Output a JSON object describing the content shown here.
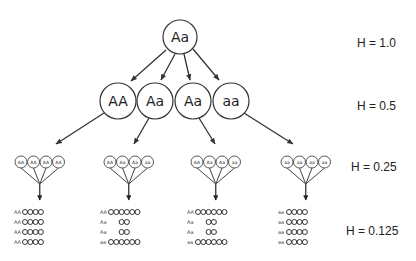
{
  "generations": [
    {
      "level": 0,
      "genotypes": [
        "Aa"
      ],
      "heterozygosity_label": "H = 1.0"
    },
    {
      "level": 1,
      "genotypes": [
        "AA",
        "Aa",
        "Aa",
        "aa"
      ],
      "heterozygosity_label": "H = 0.5"
    },
    {
      "level": 2,
      "heterozygosity_label": "H = 0.25",
      "groups": [
        {
          "parent": "AA",
          "offspring": [
            "AA",
            "AA",
            "AA",
            "AA"
          ]
        },
        {
          "parent": "Aa",
          "offspring": [
            "AA",
            "Aa",
            "Aa",
            "aa"
          ]
        },
        {
          "parent": "Aa",
          "offspring": [
            "AA",
            "Aa",
            "Aa",
            "aa"
          ]
        },
        {
          "parent": "aa",
          "offspring": [
            "aa",
            "aa",
            "aa",
            "aa"
          ]
        }
      ]
    },
    {
      "level": 3,
      "heterozygosity_label": "H = 0.125",
      "groups": [
        {
          "rows": [
            {
              "label": "AA",
              "count": 4
            },
            {
              "label": "AA",
              "count": 4
            },
            {
              "label": "AA",
              "count": 4
            },
            {
              "label": "AA",
              "count": 4
            }
          ]
        },
        {
          "rows": [
            {
              "label": "AA",
              "count": 6
            },
            {
              "label": "Aa",
              "count": 2
            },
            {
              "label": "Aa",
              "count": 2
            },
            {
              "label": "aa",
              "count": 6
            }
          ]
        },
        {
          "rows": [
            {
              "label": "AA",
              "count": 6
            },
            {
              "label": "Aa",
              "count": 2
            },
            {
              "label": "Aa",
              "count": 2
            },
            {
              "label": "aa",
              "count": 6
            }
          ]
        },
        {
          "rows": [
            {
              "label": "aa",
              "count": 4
            },
            {
              "label": "aa",
              "count": 4
            },
            {
              "label": "aa",
              "count": 4
            },
            {
              "label": "aa",
              "count": 4
            }
          ]
        }
      ]
    }
  ],
  "colors": {
    "stroke": "#333333",
    "background": "#ffffff"
  }
}
